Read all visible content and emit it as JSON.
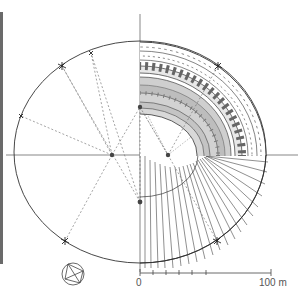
{
  "diagram": {
    "scale_bar": {
      "start_label": "0",
      "end_label": "100 m",
      "ticks": 6
    },
    "colors": {
      "ink": "#333333",
      "hatch": "#8a8a8a",
      "fill_light": "#d6d6d6",
      "fill_dark": "#a8a8a8",
      "paper": "#ffffff"
    },
    "construction": {
      "centers": [
        "left-focus",
        "right-focus",
        "lower-center",
        "upper-center"
      ],
      "quadrant_detail": "upper-right quadrant shows built structure; lower-right shows radial walls; left half shows construction lines"
    },
    "compass_rose": "circle with inscribed quadrilateral and diagonals"
  }
}
